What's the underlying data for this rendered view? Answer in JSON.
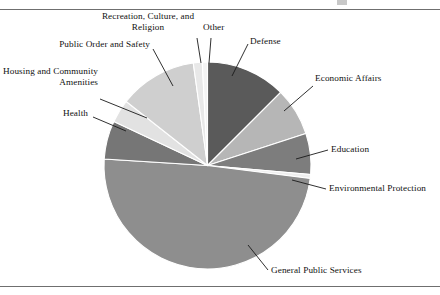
{
  "figure": {
    "kind": "pie-chart-figure",
    "has_top_rule": true,
    "has_bottom_rule": true,
    "background_color": "#ffffff",
    "leader_line_color": "#1a1a1a",
    "slice_outline_color": "#ffffff"
  },
  "chart_data": {
    "type": "pie",
    "title": "",
    "xlabel": "",
    "ylabel": "",
    "legend_position": "none",
    "labels_placement": "outside-with-leader-lines",
    "start_angle_deg": 0,
    "direction": "clockwise",
    "categories": [
      "Defense",
      "Economic Affairs",
      "Education",
      "Environmental Protection",
      "General Public Services",
      "Health",
      "Housing and Community Amenities",
      "Public Order and Safety",
      "Recreation, Culture, and Religion",
      "Other"
    ],
    "values": [
      12.5,
      7.5,
      6.4,
      0.6,
      49.0,
      6.0,
      3.6,
      12.2,
      1.4,
      0.8
    ],
    "unit": "percent",
    "colors": [
      "#5a5a5a",
      "#b6b6b6",
      "#7d7d7d",
      "#efefef",
      "#8e8e8e",
      "#767676",
      "#e2e2e2",
      "#cfcfcf",
      "#e8e8e8",
      "#f4f4f4"
    ],
    "slices": [
      {
        "name": "Defense",
        "value": 12.5,
        "color": "#5a5a5a",
        "start_deg": 0.0,
        "end_deg": 45.0
      },
      {
        "name": "Economic Affairs",
        "value": 7.5,
        "color": "#b6b6b6",
        "start_deg": 45.0,
        "end_deg": 72.0
      },
      {
        "name": "Education",
        "value": 6.4,
        "color": "#7d7d7d",
        "start_deg": 72.0,
        "end_deg": 95.0
      },
      {
        "name": "Environmental Protection",
        "value": 0.6,
        "color": "#efefef",
        "start_deg": 95.0,
        "end_deg": 97.2
      },
      {
        "name": "General Public Services",
        "value": 49.0,
        "color": "#8e8e8e",
        "start_deg": 97.2,
        "end_deg": 273.6
      },
      {
        "name": "Health",
        "value": 6.0,
        "color": "#767676",
        "start_deg": 273.6,
        "end_deg": 295.2
      },
      {
        "name": "Housing and Community Amenities",
        "value": 3.6,
        "color": "#e2e2e2",
        "start_deg": 295.2,
        "end_deg": 308.2
      },
      {
        "name": "Public Order and Safety",
        "value": 12.2,
        "color": "#cfcfcf",
        "start_deg": 308.2,
        "end_deg": 352.1
      },
      {
        "name": "Recreation, Culture, and Religion",
        "value": 1.4,
        "color": "#e8e8e8",
        "start_deg": 352.1,
        "end_deg": 357.1
      },
      {
        "name": "Other",
        "value": 0.8,
        "color": "#f4f4f4",
        "start_deg": 357.1,
        "end_deg": 360.0
      }
    ]
  },
  "labels": {
    "recreation": "Recreation, Culture, and\nReligion",
    "other": "Other",
    "public_order": "Public Order and Safety",
    "housing": "Housing and Community\nAmenities",
    "health": "Health",
    "defense": "Defense",
    "economic_affairs": "Economic Affairs",
    "education": "Education",
    "environmental_protection": "Environmental Protection",
    "general_public_services": "General Public Services"
  }
}
